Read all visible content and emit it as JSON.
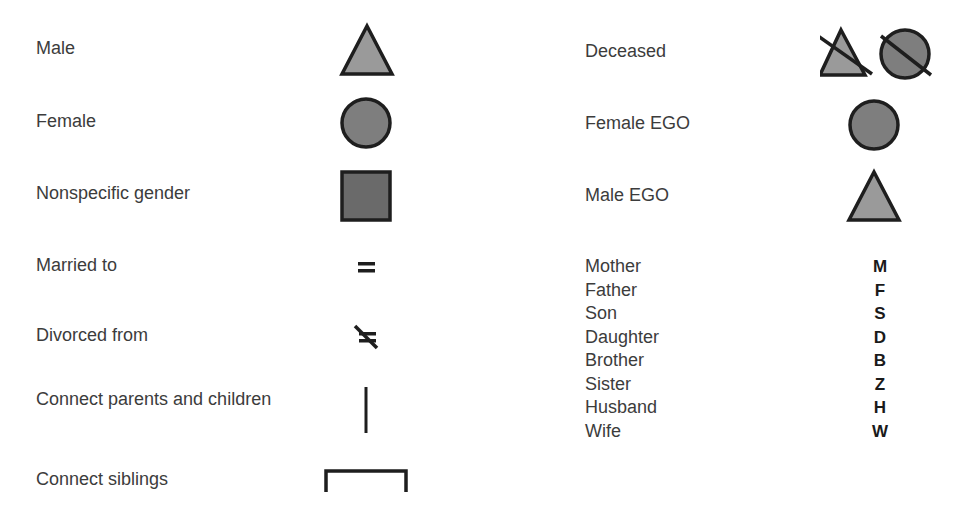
{
  "legend_left": [
    {
      "label": "Male",
      "symbol": "triangle"
    },
    {
      "label": "Female",
      "symbol": "circle"
    },
    {
      "label": "Nonspecific gender",
      "symbol": "square"
    },
    {
      "label": "Married to",
      "symbol": "equals"
    },
    {
      "label": "Divorced from",
      "symbol": "struck-equals"
    },
    {
      "label": "Connect parents and children",
      "symbol": "vertical-line"
    },
    {
      "label": "Connect siblings",
      "symbol": "bracket"
    }
  ],
  "legend_right": [
    {
      "label": "Deceased",
      "symbol": "struck-triangle-and-circle"
    },
    {
      "label": "Female EGO",
      "symbol": "circle"
    },
    {
      "label": "Male EGO",
      "symbol": "triangle"
    }
  ],
  "kin_terms": [
    {
      "term": "Mother",
      "abbr": "M"
    },
    {
      "term": "Father",
      "abbr": "F"
    },
    {
      "term": "Son",
      "abbr": "S"
    },
    {
      "term": "Daughter",
      "abbr": "D"
    },
    {
      "term": "Brother",
      "abbr": "B"
    },
    {
      "term": "Sister",
      "abbr": "Z"
    },
    {
      "term": "Husband",
      "abbr": "H"
    },
    {
      "term": "Wife",
      "abbr": "W"
    }
  ],
  "colors": {
    "male_fill": "#9a9a9a",
    "female_fill": "#7e7e7e",
    "square_fill": "#6a6a6a",
    "stroke": "#1e1e1e"
  }
}
